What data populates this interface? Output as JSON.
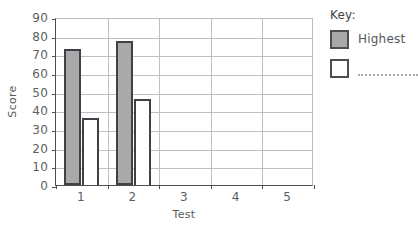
{
  "chart_data": {
    "type": "bar",
    "title": "",
    "xlabel": "Test",
    "ylabel": "Score",
    "categories": [
      "1",
      "2",
      "3",
      "4",
      "5"
    ],
    "ylim": [
      0,
      90
    ],
    "y_ticks": [
      0,
      10,
      20,
      30,
      40,
      50,
      60,
      70,
      80,
      90
    ],
    "grid": true,
    "legend_position": "right",
    "series": [
      {
        "name": "Highest",
        "values": [
          73,
          77,
          null,
          null,
          null
        ],
        "color": "#a9a9a9"
      },
      {
        "name": "",
        "values": [
          36,
          46,
          null,
          null,
          null
        ],
        "color": "#ffffff"
      }
    ]
  },
  "axes": {
    "y_title": "Score",
    "x_title": "Test",
    "y_tick_labels": [
      "90",
      "80",
      "70",
      "60",
      "50",
      "40",
      "30",
      "20",
      "10",
      "0"
    ],
    "x_tick_labels": [
      "1",
      "2",
      "3",
      "4",
      "5"
    ]
  },
  "key": {
    "title": "Key:",
    "entries": [
      {
        "label": "Highest",
        "swatch": "gray-filled-square",
        "blank": false
      },
      {
        "label": "",
        "swatch": "white-empty-square",
        "blank": true
      }
    ]
  },
  "colors": {
    "bar_highest_fill": "#a9a9a9",
    "bar_other_fill": "#ffffff",
    "bar_outline": "#3e4145",
    "gridline": "#bcbfc3",
    "axis": "#4b4e52",
    "text": "#54585c",
    "background": "#ffffff"
  }
}
